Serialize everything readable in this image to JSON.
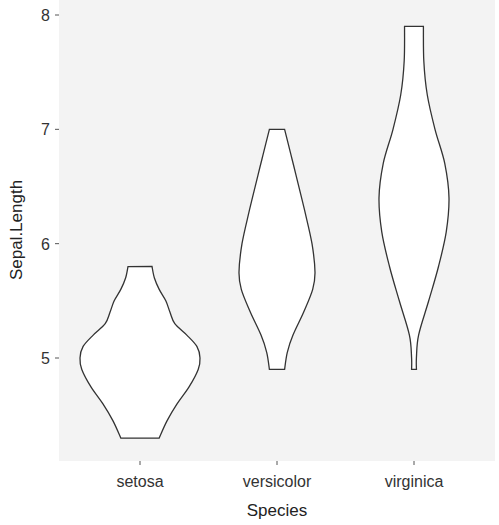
{
  "chart_data": {
    "type": "violin",
    "title": "",
    "xlabel": "Species",
    "ylabel": "Sepal.Length",
    "categories": [
      "setosa",
      "versicolor",
      "virginica"
    ],
    "y_ticks": [
      5,
      6,
      7,
      8
    ],
    "ylim": [
      4.2,
      8.1
    ],
    "grid": false,
    "legend": "none",
    "colors": {
      "panel_background": "#f3f3f3",
      "violin_fill": "#ffffff",
      "violin_stroke": "#333333",
      "text": "#333333"
    },
    "series": [
      {
        "name": "setosa",
        "min": 4.3,
        "max": 5.8,
        "mode": 5.0,
        "profile": [
          [
            4.3,
            0.32
          ],
          [
            4.45,
            0.45
          ],
          [
            4.6,
            0.62
          ],
          [
            4.75,
            0.82
          ],
          [
            4.9,
            0.97
          ],
          [
            5.0,
            1.0
          ],
          [
            5.1,
            0.95
          ],
          [
            5.2,
            0.78
          ],
          [
            5.3,
            0.58
          ],
          [
            5.4,
            0.5
          ],
          [
            5.5,
            0.43
          ],
          [
            5.6,
            0.32
          ],
          [
            5.7,
            0.24
          ],
          [
            5.8,
            0.2
          ]
        ]
      },
      {
        "name": "versicolor",
        "min": 4.9,
        "max": 7.0,
        "mode": 5.75,
        "profile": [
          [
            4.9,
            0.2
          ],
          [
            5.05,
            0.27
          ],
          [
            5.2,
            0.42
          ],
          [
            5.4,
            0.7
          ],
          [
            5.6,
            0.94
          ],
          [
            5.75,
            1.0
          ],
          [
            6.0,
            0.92
          ],
          [
            6.3,
            0.72
          ],
          [
            6.6,
            0.5
          ],
          [
            6.8,
            0.35
          ],
          [
            7.0,
            0.2
          ]
        ]
      },
      {
        "name": "virginica",
        "min": 4.9,
        "max": 7.9,
        "mode": 6.4,
        "profile": [
          [
            4.9,
            0.07
          ],
          [
            5.0,
            0.07
          ],
          [
            5.2,
            0.13
          ],
          [
            5.5,
            0.42
          ],
          [
            5.8,
            0.7
          ],
          [
            6.1,
            0.92
          ],
          [
            6.4,
            1.0
          ],
          [
            6.7,
            0.88
          ],
          [
            7.0,
            0.6
          ],
          [
            7.3,
            0.38
          ],
          [
            7.6,
            0.28
          ],
          [
            7.9,
            0.27
          ]
        ]
      }
    ]
  }
}
